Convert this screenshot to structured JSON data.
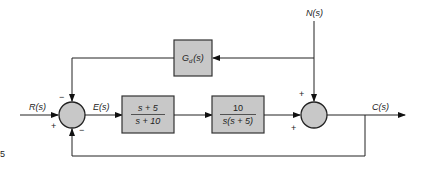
{
  "diagram": {
    "type": "control-system-block-diagram",
    "signals": {
      "input": "R(s)",
      "error": "E(s)",
      "disturbance": "N(s)",
      "output": "C(s)"
    },
    "blocks": {
      "feedforward_disturbance": {
        "label_main": "G",
        "label_sub": "d",
        "label_arg": "(s)"
      },
      "controller": {
        "numerator": "s + 5",
        "denominator": "s + 10"
      },
      "plant": {
        "numerator": "10",
        "denominator": "s(s + 5)"
      }
    },
    "summing_junction_1": {
      "signs": {
        "top": "−",
        "left": "+",
        "bottom": "−"
      }
    },
    "summing_junction_2": {
      "signs": {
        "top": "+",
        "left": "+"
      }
    },
    "margin_marker": "5"
  }
}
